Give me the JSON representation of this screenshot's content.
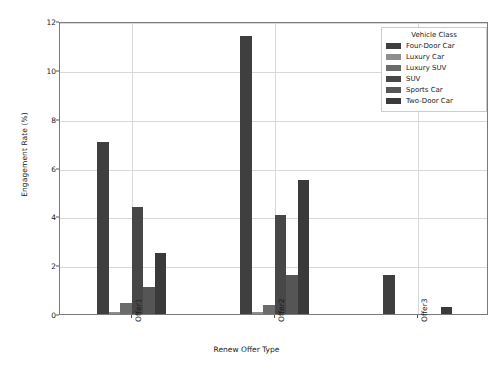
{
  "chart_data": {
    "type": "bar",
    "title": "",
    "xlabel": "Renew Offer Type",
    "ylabel": "Engagement Rate (%)",
    "categories": [
      "Offer1",
      "Offer2",
      "Offer3"
    ],
    "ylim": [
      0,
      12
    ],
    "yticks": [
      0,
      2,
      4,
      6,
      8,
      10,
      12
    ],
    "grid": true,
    "legend_position": "upper right",
    "legend_title": "Vehicle Class",
    "series": [
      {
        "name": "Four-Door Car",
        "color": "#3f3f3f",
        "values": [
          7.05,
          11.4,
          1.6
        ]
      },
      {
        "name": "Luxury Car",
        "color": "#8e8e8e",
        "values": [
          0.1,
          0.1,
          0.0
        ]
      },
      {
        "name": "Luxury SUV",
        "color": "#6b6b6b",
        "values": [
          0.45,
          0.35,
          0.0
        ]
      },
      {
        "name": "SUV",
        "color": "#474747",
        "values": [
          4.4,
          4.05,
          0.0
        ]
      },
      {
        "name": "Sports Car",
        "color": "#555555",
        "values": [
          1.1,
          1.6,
          0.0
        ]
      },
      {
        "name": "Two-Door Car",
        "color": "#3a3a3a",
        "values": [
          2.5,
          5.5,
          0.3
        ]
      }
    ]
  },
  "axes": {
    "ytick_labels": [
      "0",
      "2",
      "4",
      "6",
      "8",
      "10",
      "12"
    ],
    "xtick_labels": [
      "Offer1",
      "Offer2",
      "Offer3"
    ]
  }
}
